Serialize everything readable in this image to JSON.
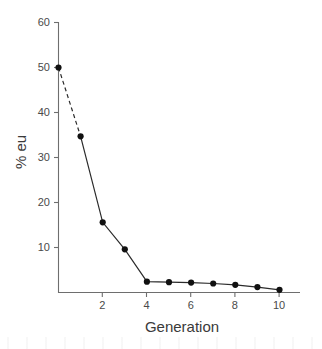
{
  "chart_data": {
    "type": "line",
    "title": "",
    "xlabel": "Generation",
    "ylabel": "% eu",
    "x": [
      0,
      1,
      2,
      3,
      4,
      5,
      6,
      7,
      8,
      9,
      10
    ],
    "values": [
      50,
      34.7,
      15.6,
      9.6,
      2.4,
      2.3,
      2.2,
      2.0,
      1.7,
      1.2,
      0.6
    ],
    "series": [
      {
        "name": "% eu",
        "values": [
          50,
          34.7,
          15.6,
          9.6,
          2.4,
          2.3,
          2.2,
          2.0,
          1.7,
          1.2,
          0.6
        ]
      }
    ],
    "xlim": [
      0,
      11
    ],
    "ylim": [
      0,
      60
    ],
    "xticks": [
      2,
      4,
      6,
      8,
      10
    ],
    "xtick_labels": [
      "2",
      "4",
      "6",
      "8",
      "10"
    ],
    "yticks": [
      10,
      20,
      30,
      40,
      50,
      60
    ],
    "ytick_labels": [
      "10",
      "20",
      "30",
      "40",
      "50",
      "60"
    ],
    "grid": false,
    "legend": "none",
    "marker": "filled-circle",
    "line_styles": [
      {
        "from_x": 0,
        "to_x": 1,
        "style": "dashed"
      },
      {
        "from_x": 1,
        "to_x": 10,
        "style": "solid"
      }
    ],
    "colors": {
      "line": "#2b2b2b",
      "marker": "#111111",
      "axis": "#6e6e6e",
      "text": "#3a3a3a",
      "background": "#ffffff"
    }
  },
  "axes": {
    "x_title": "Generation",
    "y_title": "% eu"
  },
  "y_ticks": [
    {
      "label": "60"
    },
    {
      "label": "50"
    },
    {
      "label": "40"
    },
    {
      "label": "30"
    },
    {
      "label": "20"
    },
    {
      "label": "10"
    }
  ],
  "x_ticks": [
    {
      "label": "2"
    },
    {
      "label": "4"
    },
    {
      "label": "6"
    },
    {
      "label": "8"
    },
    {
      "label": "10"
    }
  ]
}
